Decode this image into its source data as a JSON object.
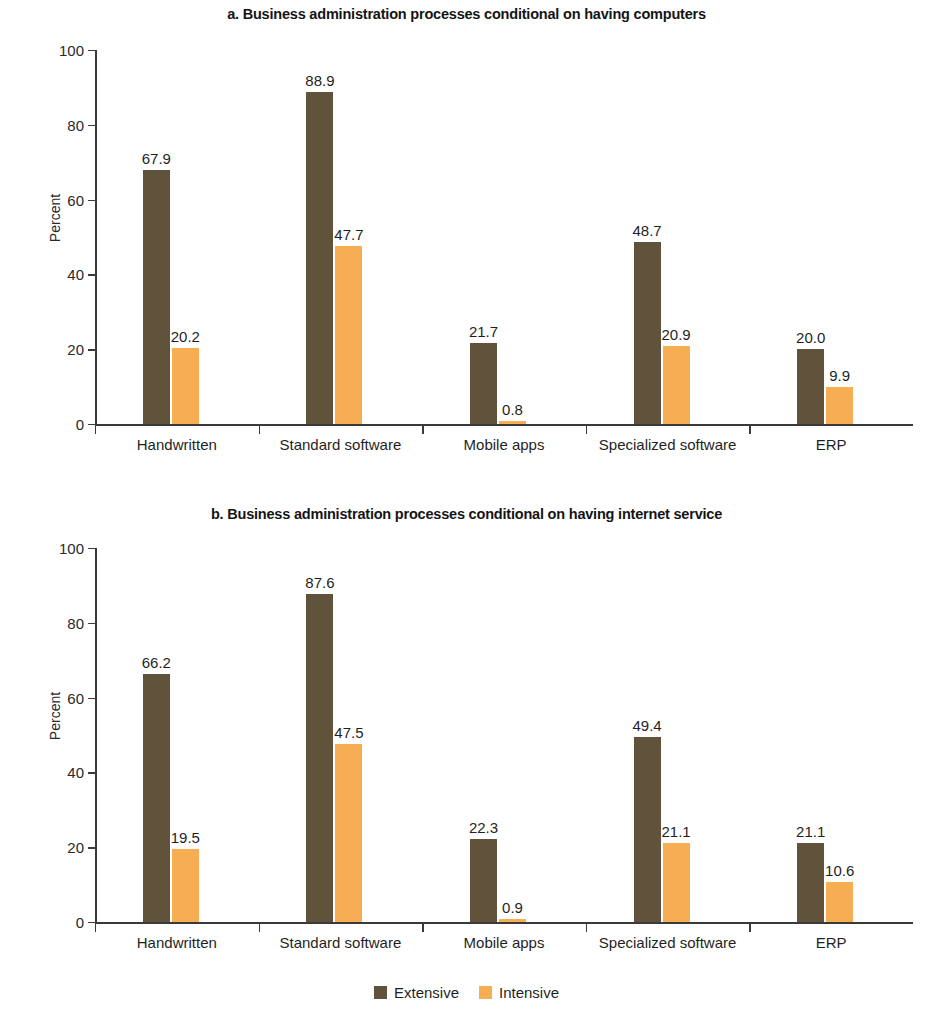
{
  "legend": {
    "items": [
      {
        "label": "Extensive",
        "color": "#61523c"
      },
      {
        "label": "Intensive",
        "color": "#f7ad52"
      }
    ]
  },
  "chart_data": [
    {
      "type": "bar",
      "id": "panel-a",
      "title": "a. Business administration processes conditional on having computers",
      "xlabel": "",
      "ylabel": "Percent",
      "ylim": [
        0,
        100
      ],
      "yticks": [
        0,
        20,
        40,
        60,
        80,
        100
      ],
      "grid": false,
      "legend_position": "bottom-shared",
      "categories": [
        "Handwritten",
        "Standard  software",
        "Mobile apps",
        "Specialized software",
        "ERP"
      ],
      "series": [
        {
          "name": "Extensive",
          "color": "#61523c",
          "values": [
            67.9,
            88.9,
            21.7,
            48.7,
            20.0
          ]
        },
        {
          "name": "Intensive",
          "color": "#f7ad52",
          "values": [
            20.2,
            47.7,
            0.8,
            20.9,
            9.9
          ]
        }
      ]
    },
    {
      "type": "bar",
      "id": "panel-b",
      "title": "b. Business administration processes conditional on having internet service",
      "xlabel": "",
      "ylabel": "Percent",
      "ylim": [
        0,
        100
      ],
      "yticks": [
        0,
        20,
        40,
        60,
        80,
        100
      ],
      "grid": false,
      "legend_position": "bottom-shared",
      "categories": [
        "Handwritten",
        "Standard software",
        "Mobile apps",
        "Specialized software",
        "ERP"
      ],
      "series": [
        {
          "name": "Extensive",
          "color": "#61523c",
          "values": [
            66.2,
            87.6,
            22.3,
            49.4,
            21.1
          ]
        },
        {
          "name": "Intensive",
          "color": "#f7ad52",
          "values": [
            19.5,
            47.5,
            0.9,
            21.1,
            10.6
          ]
        }
      ]
    }
  ]
}
